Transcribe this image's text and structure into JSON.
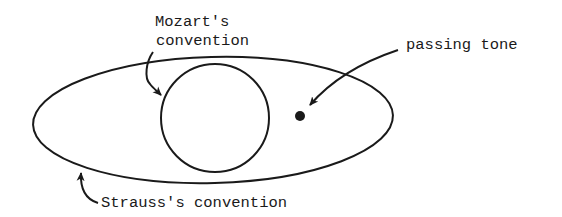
{
  "diagram": {
    "labels": {
      "mozart_line1": "Mozart's",
      "mozart_line2": "convention",
      "passing_tone": "passing tone",
      "strauss": "Strauss's convention"
    },
    "shapes": {
      "outer_ellipse": {
        "represents": "Strauss's convention",
        "cx": 213,
        "cy": 120,
        "rx": 180,
        "ry": 63
      },
      "inner_circle": {
        "represents": "Mozart's convention",
        "cx": 215,
        "cy": 118,
        "r": 54
      },
      "dot": {
        "represents": "passing tone",
        "cx": 300,
        "cy": 116,
        "r": 5
      }
    },
    "colors": {
      "ink": "#1a1a1a",
      "background": "#ffffff"
    }
  }
}
